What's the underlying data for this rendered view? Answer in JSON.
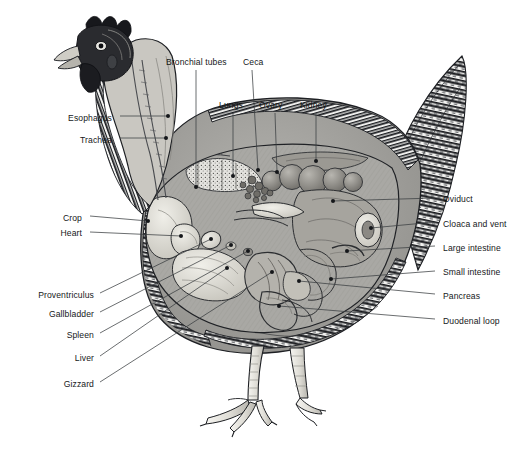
{
  "diagram": {
    "style": "black-and-white engraving / cutaway illustration",
    "background_color": "#ffffff",
    "label_color": "#16181a",
    "leader_color": "#3a3d40",
    "plumage": "barred (Plymouth Rock) feather pattern",
    "labels": [
      {
        "id": "esophagus",
        "text": "Esophagus",
        "side": "left",
        "tx": 112,
        "ty": 119,
        "lx": 120,
        "ly": 116,
        "ex": 168,
        "ey": 116
      },
      {
        "id": "trachea",
        "text": "Trachea",
        "side": "left",
        "tx": 112,
        "ty": 141,
        "lx": 120,
        "ly": 138,
        "ex": 166,
        "ey": 138
      },
      {
        "id": "bronchial-tubes",
        "text": "Bronchial tubes",
        "side": "top",
        "tx": 166,
        "ty": 63,
        "lx": 196,
        "ly": 70,
        "ex": 196,
        "ey": 187
      },
      {
        "id": "ceca",
        "text": "Ceca",
        "side": "top",
        "tx": 243,
        "ty": 63,
        "lx": 252,
        "ly": 70,
        "ex": 258,
        "ey": 170
      },
      {
        "id": "lungs",
        "text": "Lungs",
        "side": "top",
        "tx": 219,
        "ty": 106,
        "lx": 233,
        "ly": 113,
        "ex": 233,
        "ey": 176
      },
      {
        "id": "ovary",
        "text": "Ovary",
        "side": "top",
        "tx": 259,
        "ty": 106,
        "lx": 275,
        "ly": 113,
        "ex": 277,
        "ey": 172
      },
      {
        "id": "kidney",
        "text": "Kidney",
        "side": "top",
        "tx": 300,
        "ty": 106,
        "lx": 316,
        "ly": 113,
        "ex": 316,
        "ey": 161
      },
      {
        "id": "crop",
        "text": "Crop",
        "side": "left",
        "tx": 82,
        "ty": 219,
        "lx": 90,
        "ly": 216,
        "ex": 148,
        "ey": 221
      },
      {
        "id": "heart",
        "text": "Heart",
        "side": "left",
        "tx": 82,
        "ty": 234,
        "lx": 90,
        "ly": 232,
        "ex": 181,
        "ey": 236
      },
      {
        "id": "proventriculus",
        "text": "Proventriculus",
        "side": "left",
        "tx": 94,
        "ty": 296,
        "lx": 100,
        "ly": 293,
        "ex": 211,
        "ey": 239
      },
      {
        "id": "gallbladder",
        "text": "Gallbladder",
        "side": "left",
        "tx": 94,
        "ty": 315,
        "lx": 100,
        "ly": 312,
        "ex": 231,
        "ey": 245
      },
      {
        "id": "spleen",
        "text": "Spleen",
        "side": "left",
        "tx": 94,
        "ty": 336,
        "lx": 100,
        "ly": 333,
        "ex": 248,
        "ey": 251
      },
      {
        "id": "liver",
        "text": "Liver",
        "side": "left",
        "tx": 94,
        "ty": 359,
        "lx": 100,
        "ly": 356,
        "ex": 227,
        "ey": 268
      },
      {
        "id": "gizzard",
        "text": "Gizzard",
        "side": "left",
        "tx": 94,
        "ty": 385,
        "lx": 100,
        "ly": 382,
        "ex": 272,
        "ey": 272
      },
      {
        "id": "oviduct",
        "text": "Oviduct",
        "side": "right",
        "tx": 443,
        "ty": 200,
        "lx": 435,
        "ly": 198,
        "ex": 333,
        "ey": 201
      },
      {
        "id": "cloaca-and-vent",
        "text": "Cloaca and vent",
        "side": "right",
        "tx": 443,
        "ty": 225,
        "lx": 435,
        "ly": 222,
        "ex": 371,
        "ey": 228
      },
      {
        "id": "large-intestine",
        "text": "Large intestine",
        "side": "right",
        "tx": 443,
        "ty": 249,
        "lx": 435,
        "ly": 246,
        "ex": 347,
        "ey": 251
      },
      {
        "id": "small-intestine",
        "text": "Small intestine",
        "side": "right",
        "tx": 443,
        "ty": 273,
        "lx": 435,
        "ly": 271,
        "ex": 331,
        "ey": 279
      },
      {
        "id": "pancreas",
        "text": "Pancreas",
        "side": "right",
        "tx": 443,
        "ty": 297,
        "lx": 435,
        "ly": 294,
        "ex": 299,
        "ey": 281
      },
      {
        "id": "duodenal-loop",
        "text": "Duodenal loop",
        "side": "right",
        "tx": 443,
        "ty": 322,
        "lx": 435,
        "ly": 319,
        "ex": 279,
        "ey": 306
      }
    ]
  }
}
